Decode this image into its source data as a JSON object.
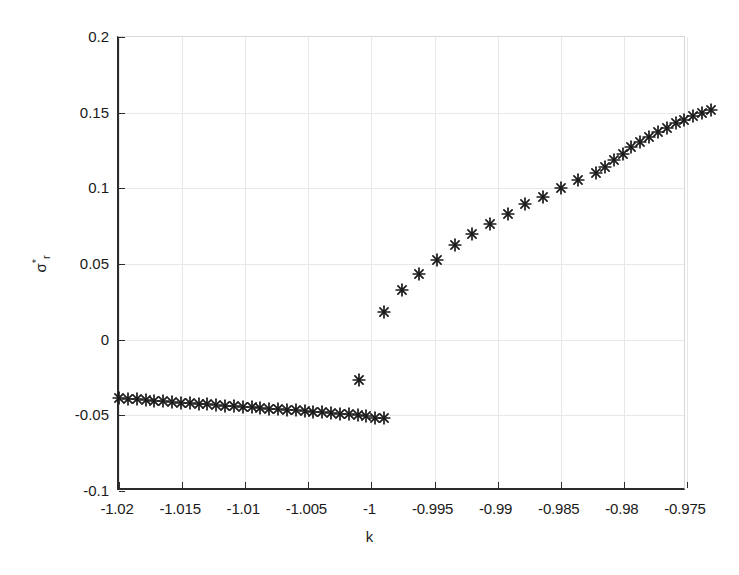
{
  "figure": {
    "background": "#ffffff",
    "axis_color": "#2b2b2b",
    "grid_color": "#e8e8e8",
    "marker_color": "#1a1a1a",
    "marker_symbol": "asterisk-marker"
  },
  "chart_data": {
    "type": "scatter",
    "title": "",
    "xlabel": "k",
    "ylabel": "σ*_r",
    "ylabel_parts": {
      "base": "σ",
      "superscript": "*",
      "subscript": "r"
    },
    "xlim": [
      -1.02,
      -0.975
    ],
    "ylim": [
      -0.1,
      0.2
    ],
    "xticks": [
      -1.02,
      -1.015,
      -1.01,
      -1.005,
      -1,
      -0.995,
      -0.99,
      -0.985,
      -0.98,
      -0.975
    ],
    "xticklabels": [
      "-1.02",
      "-1.015",
      "-1.01",
      "-1.005",
      "-1",
      "-0.995",
      "-0.99",
      "-0.985",
      "-0.98",
      "-0.975"
    ],
    "yticks": [
      -0.1,
      -0.05,
      0,
      0.05,
      0.1,
      0.15,
      0.2
    ],
    "yticklabels": [
      "-0.1",
      "-0.05",
      "0",
      "0.05",
      "0.1",
      "0.15",
      "0.2"
    ],
    "grid": true,
    "legend": "none",
    "series": [
      {
        "name": "lower-branch",
        "marker": "asterisk",
        "points": [
          [
            -1.02,
            -0.0385
          ],
          [
            -1.0193,
            -0.039
          ],
          [
            -1.0186,
            -0.0395
          ],
          [
            -1.0179,
            -0.04
          ],
          [
            -1.0172,
            -0.0404
          ],
          [
            -1.0165,
            -0.0408
          ],
          [
            -1.0158,
            -0.0412
          ],
          [
            -1.0151,
            -0.0416
          ],
          [
            -1.0144,
            -0.042
          ],
          [
            -1.0137,
            -0.0424
          ],
          [
            -1.013,
            -0.0428
          ],
          [
            -1.0123,
            -0.0432
          ],
          [
            -1.0116,
            -0.0436
          ],
          [
            -1.0109,
            -0.044
          ],
          [
            -1.0102,
            -0.0444
          ],
          [
            -1.0095,
            -0.0448
          ],
          [
            -1.0088,
            -0.0452
          ],
          [
            -1.0081,
            -0.0456
          ],
          [
            -1.0074,
            -0.046
          ],
          [
            -1.0067,
            -0.0464
          ],
          [
            -1.006,
            -0.0468
          ],
          [
            -1.0053,
            -0.0472
          ],
          [
            -1.0046,
            -0.0476
          ],
          [
            -1.0039,
            -0.048
          ],
          [
            -1.0032,
            -0.0484
          ],
          [
            -1.0025,
            -0.0489
          ],
          [
            -1.0018,
            -0.0494
          ],
          [
            -1.0011,
            -0.05
          ],
          [
            -1.0004,
            -0.0507
          ],
          [
            -0.9997,
            -0.0515
          ],
          [
            -0.999,
            -0.052
          ]
        ]
      },
      {
        "name": "isolated-point",
        "marker": "asterisk",
        "points": [
          [
            -1.001,
            -0.0265
          ]
        ]
      },
      {
        "name": "upper-branch",
        "marker": "asterisk",
        "points": [
          [
            -0.999,
            0.018
          ],
          [
            -0.9976,
            0.0325
          ],
          [
            -0.9962,
            0.0435
          ],
          [
            -0.9948,
            0.0525
          ],
          [
            -0.9934,
            0.0625
          ],
          [
            -0.992,
            0.07
          ],
          [
            -0.9906,
            0.0765
          ],
          [
            -0.9892,
            0.083
          ],
          [
            -0.9878,
            0.0895
          ],
          [
            -0.9864,
            0.0945
          ],
          [
            -0.985,
            0.1
          ],
          [
            -0.9836,
            0.1055
          ],
          [
            -0.9822,
            0.11
          ],
          [
            -0.9815,
            0.114
          ],
          [
            -0.9808,
            0.1185
          ],
          [
            -0.9801,
            0.123
          ],
          [
            -0.9794,
            0.127
          ],
          [
            -0.9787,
            0.1305
          ],
          [
            -0.978,
            0.134
          ],
          [
            -0.9773,
            0.1375
          ],
          [
            -0.9766,
            0.14
          ],
          [
            -0.9759,
            0.143
          ],
          [
            -0.9752,
            0.145
          ],
          [
            -0.9745,
            0.1475
          ],
          [
            -0.9738,
            0.1495
          ],
          [
            -0.9731,
            0.152
          ]
        ]
      }
    ]
  }
}
